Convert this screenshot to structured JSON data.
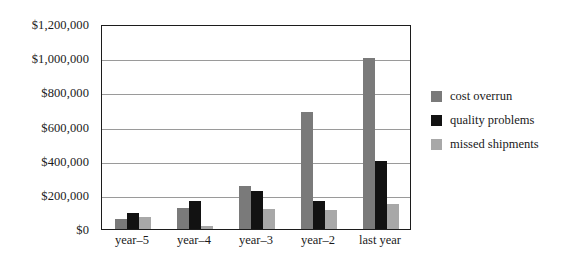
{
  "chart_data": {
    "type": "bar",
    "title": "",
    "subtitle": "",
    "xlabel": "",
    "ylabel": "",
    "categories": [
      "year–5",
      "year–4",
      "year–3",
      "year–2",
      "last year"
    ],
    "series": [
      {
        "name": "cost overrun",
        "color": "#7a7a7a",
        "values": [
          60000,
          125000,
          250000,
          685000,
          1000000
        ]
      },
      {
        "name": "quality problems",
        "color": "#121212",
        "values": [
          95000,
          165000,
          225000,
          165000,
          400000
        ]
      },
      {
        "name": "missed shipments",
        "color": "#a8a8a8",
        "values": [
          70000,
          20000,
          115000,
          110000,
          145000
        ]
      }
    ],
    "ylim": [
      0,
      1200000
    ],
    "ytick_values": [
      0,
      200000,
      400000,
      600000,
      800000,
      1000000,
      1200000
    ],
    "ytick_labels": [
      "$0",
      "$200,000",
      "$400,000",
      "$600,000",
      "$800,000",
      "$1,000,000",
      "$1,200,000"
    ],
    "grid": true,
    "grid_axis": "y",
    "legend_position": "right",
    "frame_color": "#1c1c1c",
    "gridline_color": "#9a9a9a",
    "background_color": "#ffffff"
  },
  "legend": {
    "items": [
      {
        "label": "cost overrun",
        "color": "#7a7a7a"
      },
      {
        "label": "quality problems",
        "color": "#121212"
      },
      {
        "label": "missed shipments",
        "color": "#a8a8a8"
      }
    ]
  }
}
